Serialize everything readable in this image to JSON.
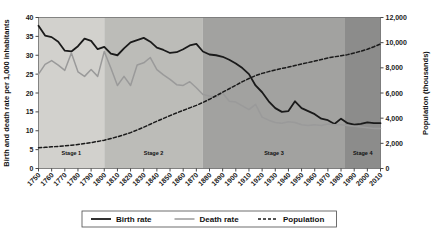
{
  "chart_data": {
    "type": "line",
    "title": "",
    "xlabel": "",
    "ylabel": "Birth and death rate per 1,000 inhabitants",
    "y2label": "Population (thousands)",
    "ylim": [
      0,
      40
    ],
    "y2lim": [
      0,
      12000
    ],
    "xlim": [
      1750,
      2010
    ],
    "grid": false,
    "legend_position": "bottom",
    "yticks": [
      "0",
      "5",
      "10",
      "15",
      "20",
      "25",
      "30",
      "35",
      "40"
    ],
    "y2ticks": [
      "0",
      "2,000",
      "4,000",
      "6,000",
      "8,000",
      "10,000",
      "12,000"
    ],
    "xticks": [
      "1750",
      "1760",
      "1770",
      "1780",
      "1790",
      "1800",
      "1810",
      "1820",
      "1830",
      "1840",
      "1850",
      "1860",
      "1870",
      "1880",
      "1890",
      "1900",
      "1910",
      "1920",
      "1930",
      "1940",
      "1950",
      "1960",
      "1970",
      "1980",
      "1990",
      "2000",
      "2010"
    ],
    "x": [
      1750,
      1755,
      1760,
      1765,
      1770,
      1775,
      1780,
      1785,
      1790,
      1795,
      1800,
      1805,
      1810,
      1815,
      1820,
      1825,
      1830,
      1835,
      1840,
      1845,
      1850,
      1855,
      1860,
      1865,
      1870,
      1875,
      1880,
      1885,
      1890,
      1895,
      1900,
      1905,
      1910,
      1915,
      1920,
      1925,
      1930,
      1935,
      1940,
      1945,
      1950,
      1955,
      1960,
      1965,
      1970,
      1975,
      1980,
      1985,
      1990,
      1995,
      2000,
      2005,
      2010
    ],
    "series": [
      {
        "name": "Birth rate",
        "axis": "left",
        "style": "solid",
        "color": "#1a1a1a",
        "width": 1.8,
        "values": [
          37.8,
          35.2,
          34.8,
          33.6,
          31.2,
          31.0,
          32.4,
          34.4,
          33.8,
          31.6,
          32.2,
          30.4,
          30.0,
          31.8,
          33.4,
          34.0,
          34.6,
          33.6,
          32.0,
          31.4,
          30.6,
          30.8,
          31.6,
          32.6,
          33.0,
          31.0,
          30.2,
          30.0,
          29.6,
          28.8,
          27.8,
          26.6,
          25.0,
          22.0,
          20.2,
          17.8,
          16.0,
          15.0,
          15.2,
          17.8,
          16.0,
          15.2,
          14.4,
          13.2,
          12.8,
          11.8,
          13.2,
          12.0,
          11.6,
          11.8,
          12.2,
          12.0,
          12.0
        ]
      },
      {
        "name": "Death rate",
        "axis": "left",
        "style": "solid",
        "color": "#9a9a9a",
        "width": 1.5,
        "values": [
          25.0,
          27.6,
          28.6,
          27.4,
          26.0,
          30.6,
          25.6,
          24.4,
          26.2,
          24.4,
          31.0,
          26.6,
          22.0,
          24.4,
          22.0,
          27.4,
          28.0,
          29.4,
          26.2,
          24.8,
          23.6,
          22.2,
          22.0,
          23.0,
          21.4,
          19.6,
          19.2,
          18.8,
          20.0,
          17.8,
          17.6,
          16.6,
          15.6,
          17.0,
          13.6,
          12.8,
          12.2,
          12.0,
          12.4,
          12.2,
          11.6,
          11.4,
          11.6,
          11.4,
          11.8,
          11.6,
          11.6,
          11.4,
          11.2,
          11.0,
          10.8,
          10.6,
          10.6
        ]
      },
      {
        "name": "Population",
        "axis": "right",
        "style": "dashed",
        "color": "#1a1a1a",
        "width": 1.5,
        "values": [
          1650,
          1680,
          1720,
          1760,
          1800,
          1850,
          1910,
          1980,
          2060,
          2150,
          2250,
          2380,
          2520,
          2680,
          2850,
          3060,
          3280,
          3520,
          3760,
          3980,
          4200,
          4420,
          4620,
          4820,
          5020,
          5250,
          5500,
          5780,
          6060,
          6340,
          6620,
          6900,
          7150,
          7380,
          7560,
          7700,
          7830,
          7950,
          8060,
          8180,
          8300,
          8420,
          8540,
          8660,
          8780,
          8880,
          8960,
          9050,
          9180,
          9320,
          9480,
          9680,
          9900
        ]
      }
    ],
    "stages": [
      {
        "label": "Stage 1",
        "start": 1750,
        "end": 1800,
        "color": "#d2d1cd"
      },
      {
        "label": "Stage 2",
        "start": 1800,
        "end": 1875,
        "color": "#bcbcb8"
      },
      {
        "label": "Stage 3",
        "start": 1875,
        "end": 1983,
        "color": "#a2a2a0"
      },
      {
        "label": "Stage 4",
        "start": 1983,
        "end": 2010,
        "color": "#8c8c8b"
      }
    ],
    "legend": [
      {
        "label": "Birth rate",
        "style": "solid",
        "color": "#1a1a1a"
      },
      {
        "label": "Death rate",
        "style": "solid",
        "color": "#9a9a9a"
      },
      {
        "label": "Population",
        "style": "dashed",
        "color": "#1a1a1a"
      }
    ]
  }
}
